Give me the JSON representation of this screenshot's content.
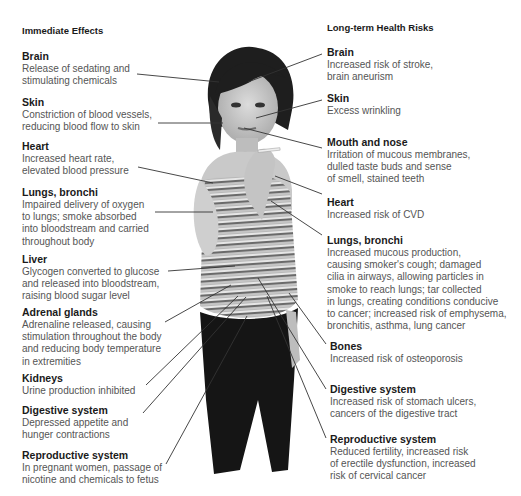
{
  "left": {
    "title": "Immediate Effects",
    "items": [
      {
        "heading": "Brain",
        "desc": "Release of sedating and\nstimulating chemicals"
      },
      {
        "heading": "Skin",
        "desc": "Constriction of blood vessels,\nreducing blood flow to skin"
      },
      {
        "heading": "Heart",
        "desc": "Increased heart rate,\nelevated blood pressure"
      },
      {
        "heading": "Lungs, bronchi",
        "desc": "Impaired delivery of oxygen\nto lungs; smoke absorbed\ninto bloodstream and carried\nthroughout body"
      },
      {
        "heading": "Liver",
        "desc": "Glycogen converted to glucose\nand released into bloodstream,\nraising blood sugar level"
      },
      {
        "heading": "Adrenal glands",
        "desc": "Adrenaline released, causing\nstimulation throughout the body\nand reducing body temperature\nin extremities"
      },
      {
        "heading": "Kidneys",
        "desc": "Urine production inhibited"
      },
      {
        "heading": "Digestive system",
        "desc": "Depressed appetite and\nhunger contractions"
      },
      {
        "heading": "Reproductive system",
        "desc": "In pregnant women, passage of\nnicotine and chemicals to fetus"
      }
    ]
  },
  "right": {
    "title": "Long-term Health Risks",
    "items": [
      {
        "heading": "Brain",
        "desc": "Increased risk of stroke,\nbrain aneurism"
      },
      {
        "heading": "Skin",
        "desc": "Excess wrinkling"
      },
      {
        "heading": "Mouth and nose",
        "desc": "Irritation of mucous membranes,\ndulled taste buds and sense\nof smell, stained teeth"
      },
      {
        "heading": "Heart",
        "desc": "Increased risk of CVD"
      },
      {
        "heading": "Lungs, bronchi",
        "desc": "Increased mucous production,\ncausing smoker's cough; damaged\ncilia in airways, allowing particles in\nsmoke to reach lungs; tar collected\nin lungs, creating conditions conducive\nto cancer; increased risk of emphysema,\nbronchitis, asthma, lung cancer"
      },
      {
        "heading": "Bones",
        "desc": "Increased risk of osteoporosis"
      },
      {
        "heading": "Digestive system",
        "desc": "Increased risk of stomach ulcers,\ncancers of the digestive tract"
      },
      {
        "heading": "Reproductive system",
        "desc": "Reduced fertility, increased risk\nof erectile dysfunction, increased\nrisk of cervical cancer"
      }
    ]
  },
  "colors": {
    "heading": "#1a1a1a",
    "body": "#555555",
    "leader_line": "#333333"
  }
}
